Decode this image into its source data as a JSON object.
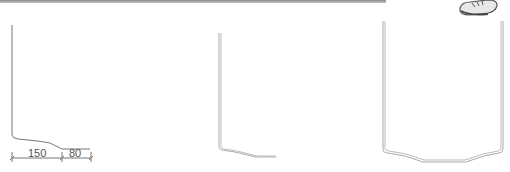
{
  "diagram": {
    "type": "pot-wall-cross-sections",
    "profiles": [
      {
        "name": "profile-single-wall-with-dimensions",
        "dimensions": [
          "150",
          "80"
        ]
      },
      {
        "name": "profile-double-line-half-section"
      },
      {
        "name": "profile-full-vessel-section"
      }
    ],
    "dimension_labels": {
      "base_inner": "150",
      "base_outer": "80"
    },
    "icon": "shoe-sketch-icon",
    "colors": {
      "line": "#777777",
      "double_line": "#9a9a9a",
      "top_bar": "#9a9a9a"
    }
  }
}
